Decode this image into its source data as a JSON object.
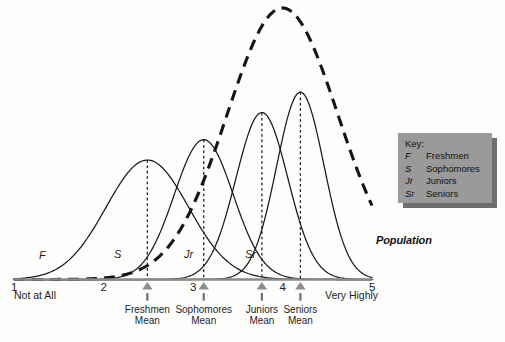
{
  "chart_data": {
    "type": "line",
    "title": "",
    "subtitle": "",
    "xlabel": "",
    "ylabel": "",
    "xlim": [
      1,
      5
    ],
    "ylim": [
      0,
      1
    ],
    "grid": false,
    "legend_position": "right",
    "x_ticks": [
      {
        "value": 1,
        "label": "1"
      },
      {
        "value": 2,
        "label": "2"
      },
      {
        "value": 3,
        "label": "3"
      },
      {
        "value": 4,
        "label": "4"
      },
      {
        "value": 5,
        "label": "5"
      }
    ],
    "x_anchor_low": "Not at All",
    "x_anchor_high": "Very Highly",
    "series": [
      {
        "name": "Freshmen",
        "abbr": "F",
        "style": "solid",
        "mean": 2.49,
        "sd": 0.46,
        "peak_height": 0.44,
        "mean_label_line1": "Freshmen",
        "mean_label_line2": "Mean"
      },
      {
        "name": "Sophomores",
        "abbr": "S",
        "style": "solid",
        "mean": 3.12,
        "sd": 0.33,
        "peak_height": 0.515,
        "mean_label_line1": "Sophomores",
        "mean_label_line2": "Mean"
      },
      {
        "name": "Juniors",
        "abbr": "Jr",
        "style": "solid",
        "mean": 3.77,
        "sd": 0.29,
        "peak_height": 0.615,
        "mean_label_line1": "Juniors",
        "mean_label_line2": "Mean"
      },
      {
        "name": "Seniors",
        "abbr": "Sr",
        "style": "solid",
        "mean": 4.2,
        "sd": 0.265,
        "peak_height": 0.69,
        "mean_label_line1": "Seniors",
        "mean_label_line2": "Mean"
      },
      {
        "name": "Population",
        "abbr": "Population",
        "style": "dashed",
        "mean": 4.0,
        "sd": 0.62,
        "peak_height": 1.0,
        "mean_label_line1": "",
        "mean_label_line2": ""
      }
    ],
    "annotations": [
      {
        "text": "Population",
        "kind": "curve-label",
        "target": "Population"
      },
      {
        "text": "F",
        "kind": "curve-label",
        "target": "Freshmen"
      },
      {
        "text": "S",
        "kind": "curve-label",
        "target": "Sophomores"
      },
      {
        "text": "Jr",
        "kind": "curve-label",
        "target": "Juniors"
      },
      {
        "text": "Sr",
        "kind": "curve-label",
        "target": "Seniors"
      }
    ]
  },
  "legend": {
    "title": "Key:",
    "items": [
      {
        "abbr": "F",
        "name": "Freshmen"
      },
      {
        "abbr": "S",
        "name": "Sophomores"
      },
      {
        "abbr": "Jr",
        "name": "Juniors"
      },
      {
        "abbr": "Sr",
        "name": "Seniors"
      }
    ]
  },
  "colors": {
    "background": "#fdfdfc",
    "curve": "#1a1a1a",
    "population_curve": "#151515",
    "axis": "#8a8a8a",
    "marker": "#8d8d8d",
    "legend_fill": "#9a9a9a",
    "legend_shadow": "#6e6e6e",
    "text": "#1d1d1d"
  }
}
